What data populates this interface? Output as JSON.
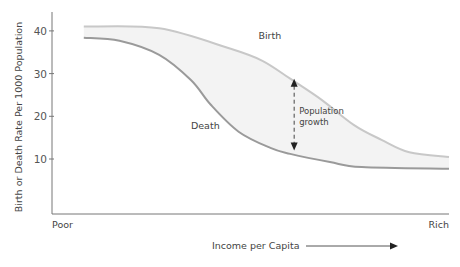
{
  "chart_data": {
    "type": "line",
    "title": "",
    "xlabel": "Income per Capita",
    "ylabel": "Birth or Death Rate Per 1000 Population",
    "x_tick_labels": {
      "start": "Poor",
      "end": "Rich"
    },
    "x_range": [
      0,
      100
    ],
    "ylim": [
      0,
      45
    ],
    "y_ticks": [
      10,
      20,
      30,
      40
    ],
    "grid": false,
    "legend": "none",
    "series": [
      {
        "name": "Birth",
        "color": "#c8c8c8",
        "x": [
          8,
          27,
          45,
          53,
          60,
          68,
          76,
          83,
          90,
          100
        ],
        "values": [
          41,
          40.6,
          35.8,
          33,
          28.8,
          23.8,
          18,
          14.5,
          11.6,
          10.5
        ]
      },
      {
        "name": "Death",
        "color": "#9a9a9a",
        "x": [
          8,
          17,
          27,
          35,
          40,
          47,
          55,
          60,
          70,
          78,
          100
        ],
        "values": [
          38.4,
          37.7,
          34.4,
          28.5,
          22.7,
          16.4,
          12.6,
          11.2,
          9.3,
          8.1,
          7.7
        ]
      }
    ],
    "fill_between": {
      "series": [
        "Birth",
        "Death"
      ],
      "color": "#f3f3f3"
    },
    "annotations": [
      {
        "text": "Birth",
        "x": 52,
        "y": 38
      },
      {
        "text": "Death",
        "x": 35,
        "y": 17
      },
      {
        "text_lines": [
          "Population",
          "growth"
        ],
        "x": 61,
        "arrow_from": 28.8,
        "arrow_to": 12,
        "style": "dashed-double-arrow"
      }
    ],
    "x_axis_arrow": {
      "label": "Income per Capita",
      "direction": "right"
    }
  }
}
